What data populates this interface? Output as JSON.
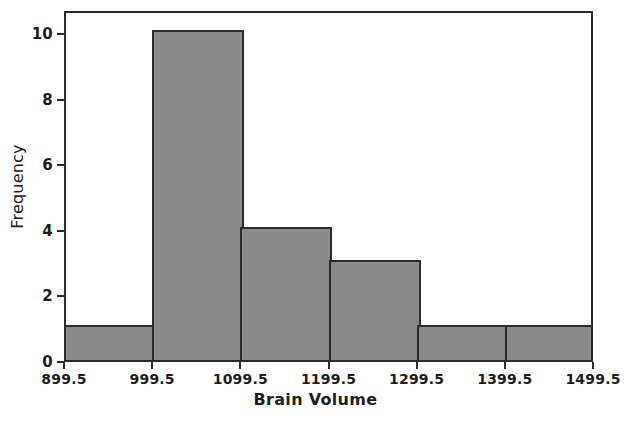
{
  "chart_data": {
    "type": "bar",
    "chart_subtype": "histogram",
    "title": "",
    "xlabel": "Brain Volume",
    "ylabel": "Frequency",
    "categories": [
      "899.5-999.5",
      "999.5-1099.5",
      "1099.5-1199.5",
      "1199.5-1299.5",
      "1299.5-1399.5",
      "1399.5-1499.5"
    ],
    "bin_edges": [
      899.5,
      999.5,
      1099.5,
      1199.5,
      1299.5,
      1399.5,
      1499.5
    ],
    "bin_width": 100,
    "values": [
      1,
      10,
      4,
      3,
      1,
      1
    ],
    "total_count": 20,
    "xticks": [
      "899.5",
      "999.5",
      "1099.5",
      "1199.5",
      "1299.5",
      "1399.5",
      "1499.5"
    ],
    "xtick_values": [
      899.5,
      999.5,
      1099.5,
      1199.5,
      1299.5,
      1399.5,
      1499.5
    ],
    "yticks": [
      "0",
      "2",
      "4",
      "6",
      "8",
      "10"
    ],
    "ytick_values": [
      0,
      2,
      4,
      6,
      8,
      10
    ],
    "xlim": [
      899.5,
      1499.5
    ],
    "ylim": [
      0,
      10.7
    ],
    "grid": false,
    "legend": false,
    "legend_position": "none",
    "colors": {
      "bar_fill": "#8a8a8a",
      "bar_edge": "#2b2b2b",
      "axis": "#2b2b2b",
      "text": "#1c1c1c",
      "plot_background": "#ffffff",
      "figure_background": "#ffffff"
    }
  },
  "axes": {
    "x_title": "Brain Volume",
    "y_title": "Frequency"
  }
}
